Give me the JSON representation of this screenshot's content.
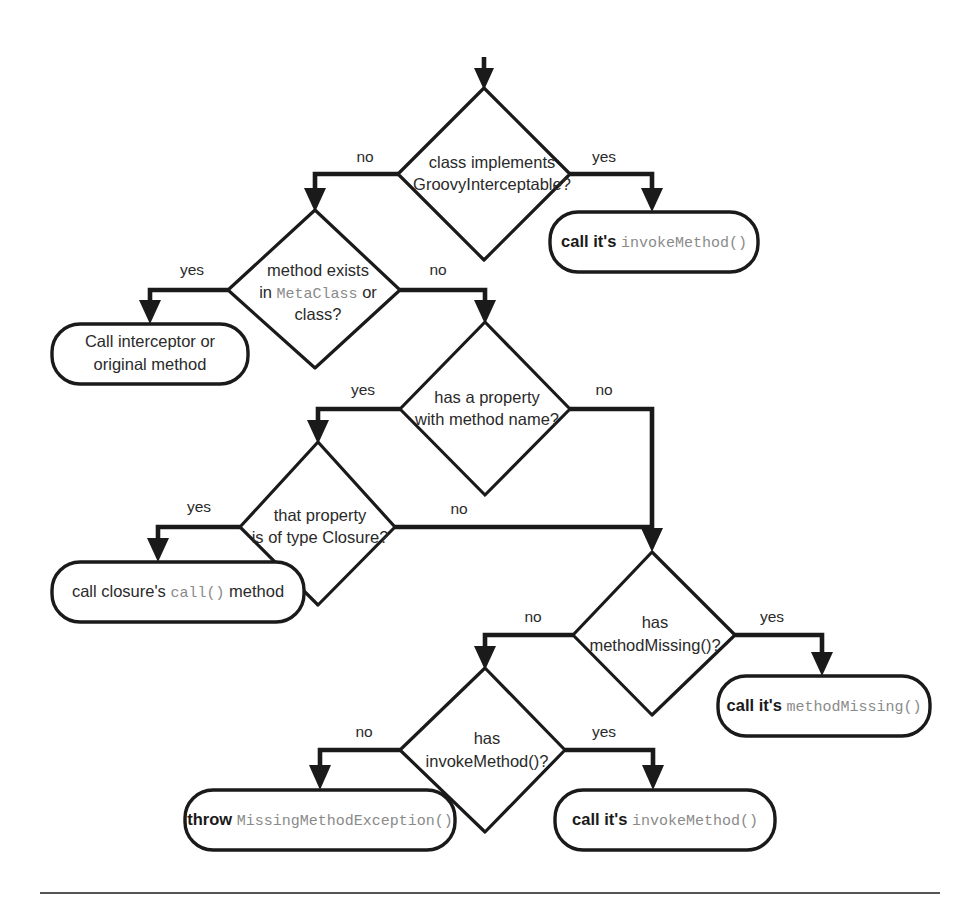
{
  "diagram": {
    "colors": {
      "stroke": "#1a1a1a",
      "background": "#ffffff",
      "mono_text": "#8a8a8a",
      "rule": "#555555"
    },
    "entry": {
      "name": "entry-arrow"
    },
    "decisions": [
      {
        "id": "class-implements-groovyinterceptable",
        "line1": "class implements",
        "line2_mono": "GroovyInterceptable?",
        "yes_label": "yes",
        "no_label": "no"
      },
      {
        "id": "method-exists-in-metaclass-or-class",
        "line1": "method exists",
        "line2_pre": "in ",
        "line2_mono": "MetaClass",
        "line2_post": " or",
        "line3": "class?",
        "yes_label": "yes",
        "no_label": "no"
      },
      {
        "id": "has-a-property-with-method-name",
        "line1": "has a property",
        "line2": "with method name?",
        "yes_label": "yes",
        "no_label": "no"
      },
      {
        "id": "that-property-is-of-type-closure",
        "line1": "that property",
        "line2": "is of type Closure?",
        "yes_label": "yes",
        "no_label": "no"
      },
      {
        "id": "has-methodmissing",
        "line1": "has",
        "line2_mono": "methodMissing()?",
        "yes_label": "yes",
        "no_label": "no"
      },
      {
        "id": "has-invokemethod",
        "line1": "has",
        "line2_mono": "invokeMethod()?",
        "yes_label": "yes",
        "no_label": "no"
      }
    ],
    "terminals": [
      {
        "id": "call-its-invokemethod-top",
        "bold": "call it's",
        "mono": "invokeMethod()"
      },
      {
        "id": "call-interceptor-or-original-method",
        "line1": "Call interceptor or",
        "line2": "original method"
      },
      {
        "id": "call-closures-call-method",
        "pre": "call closure's",
        "mono": "call()",
        "post": "method"
      },
      {
        "id": "call-its-methodmissing",
        "bold": "call it's",
        "mono": "methodMissing()"
      },
      {
        "id": "throw-missingmethodexception",
        "bold": "throw",
        "mono": "MissingMethodException()"
      },
      {
        "id": "call-its-invokemethod-bottom",
        "bold": "call it's",
        "mono": "invokeMethod()"
      }
    ],
    "edge_labels": {
      "d1_no": "no",
      "d1_yes": "yes",
      "d2_yes": "yes",
      "d2_no": "no",
      "d3_yes": "yes",
      "d3_no": "no",
      "d4_yes": "yes",
      "d4_no": "no",
      "d5_no": "no",
      "d5_yes": "yes",
      "d6_no": "no",
      "d6_yes": "yes"
    }
  }
}
